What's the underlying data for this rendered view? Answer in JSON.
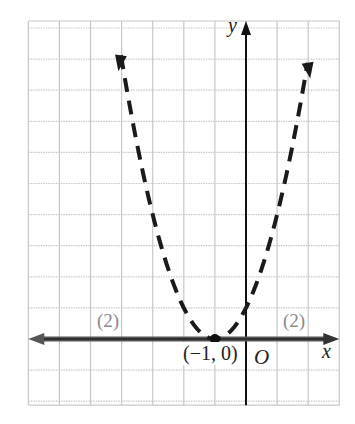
{
  "chart_data": {
    "type": "line",
    "title": "",
    "equation": "y = (x + 1)^2",
    "line_style": "dashed",
    "xlabel": "x",
    "ylabel": "y",
    "origin_label": "O",
    "xlim": [
      -7,
      3
    ],
    "ylim": [
      -2,
      10
    ],
    "grid": true,
    "grid_step": 1,
    "series": [
      {
        "name": "parabola",
        "style": "dashed",
        "x": [
          -4.2,
          -4,
          -3,
          -2,
          -1,
          0,
          1,
          2,
          2.15
        ],
        "y": [
          10.24,
          9,
          4,
          1,
          0,
          1,
          4,
          9,
          9.92
        ]
      },
      {
        "name": "x-axis line",
        "style": "solid-thick",
        "x": [
          -7,
          3
        ],
        "y": [
          0,
          0
        ]
      }
    ],
    "points": [
      {
        "x": -1,
        "y": 0,
        "label": "(−1, 0)"
      }
    ],
    "annotations": [
      {
        "text": "(2)",
        "x": -4.5,
        "y": 0.6
      },
      {
        "text": "(2)",
        "x": 1.5,
        "y": 0.6
      }
    ],
    "colors": {
      "grid": "#c8c8c8",
      "curve": "#1a1a1a",
      "axis_band": "#555555",
      "annotation": "#8a8a8a"
    }
  },
  "labels": {
    "y_axis": "y",
    "x_axis": "x",
    "origin": "O",
    "vertex": "(−1, 0)",
    "multiplicity_left": "(2)",
    "multiplicity_right": "(2)"
  }
}
